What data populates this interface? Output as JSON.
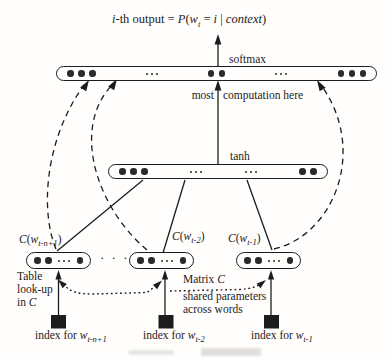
{
  "colors": {
    "ink": "#1c1c1c",
    "dot": "#2a2a2a",
    "bg": "#fffefc"
  },
  "formula": {
    "i": "i",
    "a": "-th output = ",
    "P": "P",
    "b": "(",
    "w": "w",
    "wsub": "t",
    "c": " = ",
    "i2": "i",
    "d": " | ",
    "context": "context",
    "e": ")"
  },
  "layers": {
    "softmax": {
      "label": "softmax",
      "dots": [
        "3",
        "e",
        "2",
        "e",
        "3"
      ]
    },
    "most_computation": {
      "a": "most",
      "b": "computation here"
    },
    "tanh": {
      "label": "tanh",
      "dots": [
        "3",
        "e",
        "e",
        "2"
      ]
    },
    "between_ellipsis": "· · ·",
    "embeddings": [
      {
        "sym": "C",
        "open": "(",
        "w": "w",
        "sub": "t-n+1",
        "close": ")",
        "dots": [
          "2",
          "e",
          "1"
        ]
      },
      {
        "sym": "C",
        "open": "(",
        "w": "w",
        "sub": "t-2",
        "close": ")",
        "dots": [
          "2",
          "e",
          "1"
        ]
      },
      {
        "sym": "C",
        "open": "(",
        "w": "w",
        "sub": "t-1",
        "close": ")",
        "dots": [
          "2",
          "e",
          "1"
        ]
      }
    ]
  },
  "annotations": {
    "table_lookup": {
      "line1": "Table",
      "line2": "look-up",
      "line3a": "in ",
      "line3b": "C"
    },
    "matrix": {
      "a": "Matrix ",
      "b": "C"
    },
    "shared": {
      "line1": "shared parameters",
      "line2": "across words"
    }
  },
  "inputs": [
    {
      "prefix": "index for ",
      "w": "w",
      "sub": "t-n+1"
    },
    {
      "prefix": "index for ",
      "w": "w",
      "sub": "t-2"
    },
    {
      "prefix": "index for ",
      "w": "w",
      "sub": "t-1"
    }
  ]
}
